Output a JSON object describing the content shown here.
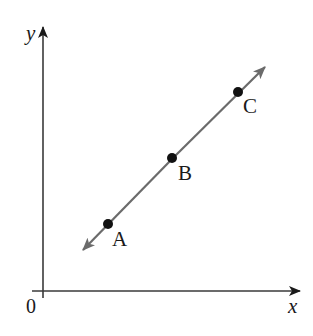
{
  "diagram": {
    "type": "coordinate-plane-line",
    "axes": {
      "x_label": "x",
      "y_label": "y",
      "origin_label": "0"
    },
    "line": {
      "description": "line through points A, B, C with arrows at both ends",
      "color": "#6b6b6b"
    },
    "points": [
      {
        "label": "A",
        "px": [
          108,
          224
        ]
      },
      {
        "label": "B",
        "px": [
          172,
          158
        ]
      },
      {
        "label": "C",
        "px": [
          238,
          92
        ]
      }
    ],
    "colors": {
      "axis": "#3a3a3a",
      "line": "#6b6b6b",
      "point": "#111111",
      "background": "#ffffff"
    }
  }
}
